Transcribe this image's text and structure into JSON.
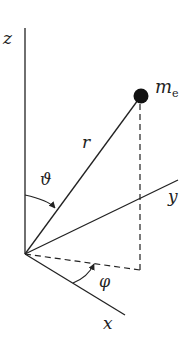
{
  "diagram": {
    "axes": {
      "z": "z",
      "y": "y",
      "x": "x"
    },
    "labels": {
      "radius": "r",
      "polar_angle": "ϑ",
      "azimuth_angle": "φ",
      "mass_symbol": "m",
      "mass_subscript": "e"
    },
    "colors": {
      "line": "#222222",
      "particle": "#111111",
      "background": "#ffffff"
    }
  }
}
